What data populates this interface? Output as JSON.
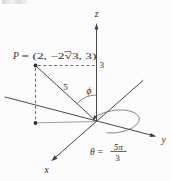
{
  "figure": {
    "type": "3d-spherical-coordinates-diagram",
    "ink": "#3f3f3f",
    "background": "#fcfcfc",
    "point": {
      "p_symbol": "P",
      "p_coords": "= (2, −2√3, 3)"
    },
    "axes": {
      "x_label": "x",
      "y_label": "y",
      "z_label": "z"
    },
    "measurements": {
      "rho_length": "5",
      "z_height": "3"
    },
    "angles": {
      "phi_symbol": "ϕ",
      "theta_prefix": "θ =",
      "theta_numerator": "5π",
      "theta_denominator": "3"
    }
  }
}
